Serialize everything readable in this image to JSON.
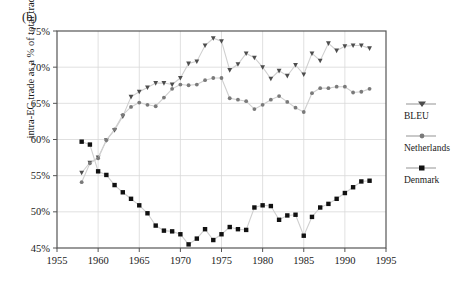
{
  "panel": {
    "label": "(b)"
  },
  "axes": {
    "ylabel": "intra-EC trade as a % of total trade",
    "yticks": [
      "75%",
      "70%",
      "65%",
      "60%",
      "55%",
      "50%",
      "45%"
    ],
    "xticks": [
      "1955",
      "1960",
      "1965",
      "1970",
      "1975",
      "1980",
      "1985",
      "1990",
      "1995"
    ]
  },
  "legend": {
    "items": [
      {
        "label": "BLEU",
        "marker": "triangle-down-marker",
        "color": "#4d4d4d"
      },
      {
        "label": "Netherlands",
        "marker": "circle-marker",
        "color": "#6b6b6b"
      },
      {
        "label": "Denmark",
        "marker": "square-marker",
        "color": "#111111"
      }
    ]
  },
  "chart_data": {
    "type": "line",
    "title": "",
    "xlabel": "",
    "ylabel": "intra-EC trade as a % of total trade",
    "xlim": [
      1955,
      1995
    ],
    "ylim": [
      45,
      75
    ],
    "xticks": [
      1955,
      1960,
      1965,
      1970,
      1975,
      1980,
      1985,
      1990,
      1995
    ],
    "yticks": [
      45,
      50,
      55,
      60,
      65,
      70,
      75
    ],
    "grid": true,
    "legend_position": "right-outside",
    "x": [
      1958,
      1959,
      1960,
      1961,
      1962,
      1963,
      1964,
      1965,
      1966,
      1967,
      1968,
      1969,
      1970,
      1971,
      1972,
      1973,
      1974,
      1975,
      1976,
      1977,
      1978,
      1979,
      1980,
      1981,
      1982,
      1983,
      1984,
      1985,
      1986,
      1987,
      1988,
      1989,
      1990,
      1991,
      1992,
      1993
    ],
    "series": [
      {
        "name": "BLEU",
        "marker": "triangle-down-marker",
        "color": "#4d4d4d",
        "values": [
          55.4,
          56.8,
          57.5,
          59.9,
          61.3,
          63.2,
          65.9,
          66.6,
          67.2,
          67.8,
          67.8,
          67.6,
          68.5,
          70.5,
          70.8,
          73.0,
          74.0,
          73.6,
          69.6,
          70.4,
          71.9,
          71.3,
          70.0,
          68.4,
          69.5,
          68.8,
          70.3,
          69.0,
          71.9,
          70.9,
          73.3,
          72.3,
          72.9,
          73.0,
          73.0,
          72.6
        ]
      },
      {
        "name": "Netherlands",
        "marker": "circle-marker",
        "color": "#7a7a7a",
        "values": [
          54.1,
          56.7,
          57.4,
          59.9,
          61.4,
          63.4,
          64.5,
          65.1,
          64.8,
          64.6,
          65.8,
          67.0,
          67.6,
          67.5,
          67.6,
          68.2,
          68.5,
          68.5,
          65.7,
          65.5,
          65.3,
          64.2,
          64.8,
          65.5,
          66.0,
          65.2,
          64.4,
          63.8,
          66.4,
          67.1,
          67.1,
          67.3,
          67.3,
          66.5,
          66.6,
          67.0
        ]
      },
      {
        "name": "Denmark",
        "marker": "square-marker",
        "color": "#111111",
        "values": [
          59.7,
          59.3,
          55.6,
          55.1,
          53.7,
          52.7,
          51.8,
          50.9,
          49.8,
          48.1,
          47.4,
          47.3,
          46.9,
          45.5,
          46.3,
          47.6,
          46.1,
          46.9,
          47.9,
          47.6,
          47.5,
          50.6,
          50.9,
          50.8,
          48.9,
          49.5,
          49.6,
          46.7,
          49.3,
          50.6,
          51.1,
          51.8,
          52.6,
          53.4,
          54.2,
          54.3
        ]
      }
    ]
  }
}
